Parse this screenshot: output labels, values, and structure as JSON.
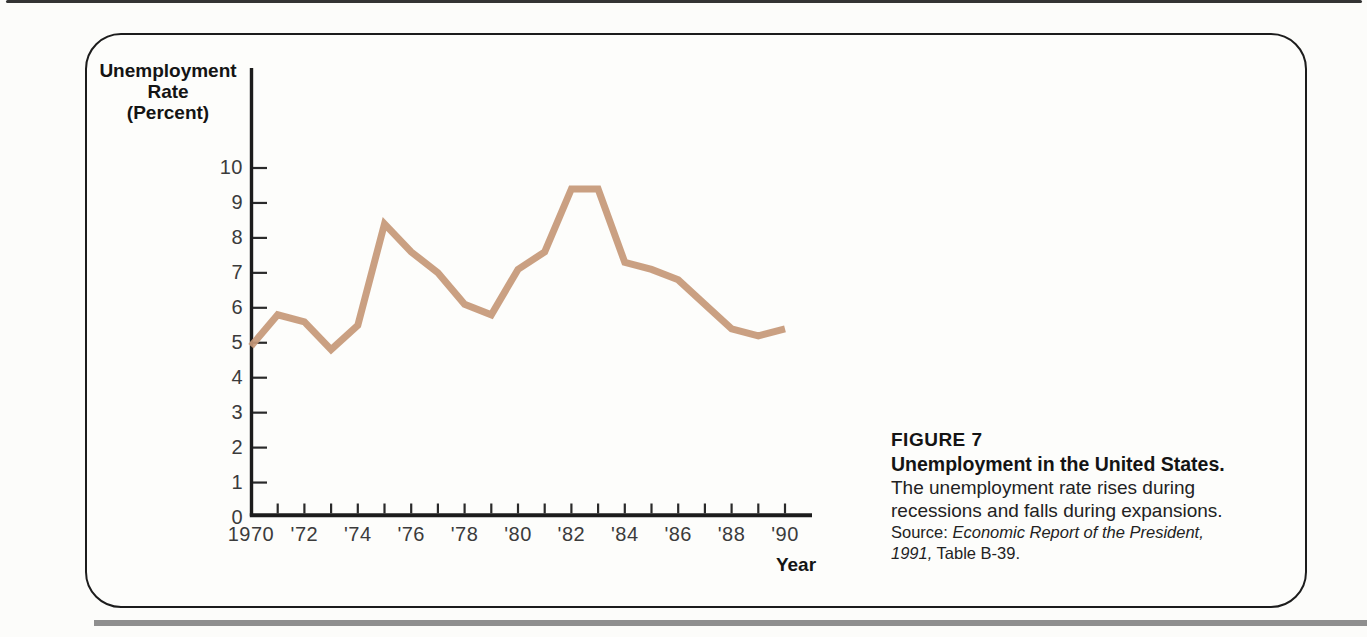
{
  "figure": {
    "y_axis_title": "Unemployment\nRate\n(Percent)",
    "x_axis_title": "Year"
  },
  "caption": {
    "figure_label": "FIGURE 7",
    "title": "Unemployment in the United States.",
    "body_line1": "The unemployment rate rises during",
    "body_line2": "recessions and falls during expansions.",
    "source_prefix": "Source: ",
    "source_title": "Economic Report of the President,",
    "source_year": "1991,",
    "source_table": " Table B-39."
  },
  "colors": {
    "line": "#c59877",
    "axis": "#1c1c1c",
    "tick": "#2a2a2a",
    "text": "#141414"
  },
  "chart_data": {
    "type": "line",
    "xlabel": "Year",
    "ylabel": "Unemployment Rate (Percent)",
    "x": [
      1970,
      1971,
      1972,
      1973,
      1974,
      1975,
      1976,
      1977,
      1978,
      1979,
      1980,
      1981,
      1982,
      1983,
      1984,
      1985,
      1986,
      1987,
      1988,
      1989,
      1990
    ],
    "values": [
      4.9,
      5.8,
      5.6,
      4.8,
      5.5,
      8.4,
      7.6,
      7.0,
      6.1,
      5.8,
      7.1,
      7.6,
      9.4,
      9.4,
      7.3,
      7.1,
      6.8,
      6.1,
      5.4,
      5.2,
      5.4
    ],
    "ylim": [
      0,
      10
    ],
    "y_ticks": [
      0,
      1,
      2,
      3,
      4,
      5,
      6,
      7,
      8,
      9,
      10
    ],
    "x_tick_years": [
      1970,
      1972,
      1974,
      1976,
      1978,
      1980,
      1982,
      1984,
      1986,
      1988,
      1990
    ],
    "x_tick_labels": [
      "1970",
      "'72",
      "'74",
      "'76",
      "'78",
      "'80",
      "'82",
      "'84",
      "'86",
      "'88",
      "'90"
    ],
    "minor_x_tick_years": [
      1971,
      1972,
      1973,
      1974,
      1975,
      1976,
      1977,
      1978,
      1979,
      1980,
      1981,
      1982,
      1983,
      1984,
      1985,
      1986,
      1987,
      1988,
      1989,
      1990
    ],
    "line_color": "#c59877",
    "grid": false,
    "legend_position": "none"
  }
}
